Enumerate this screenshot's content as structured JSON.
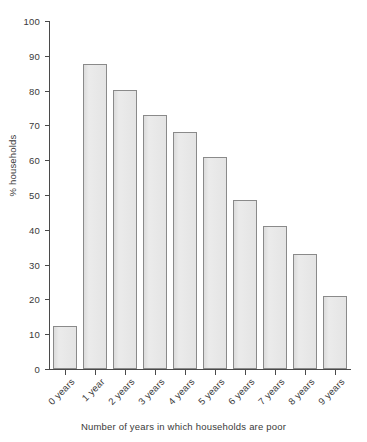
{
  "chart_data": {
    "type": "bar",
    "title": "",
    "xlabel": "Number of years in which households are poor",
    "ylabel": "% households",
    "categories": [
      "0 years",
      "1 year",
      "2 years",
      "3 years",
      "4 years",
      "5 years",
      "6 years",
      "7 years",
      "8 years",
      "9 years"
    ],
    "values": [
      12.4,
      87.6,
      80.2,
      73.0,
      68.1,
      60.9,
      48.6,
      41.1,
      33.0,
      21.0
    ],
    "ylim": [
      0,
      100
    ],
    "yticks": [
      0,
      10,
      20,
      30,
      40,
      50,
      60,
      70,
      80,
      90,
      100
    ],
    "ytick_labels": [
      "0",
      "10",
      "20",
      "30",
      "40",
      "50",
      "60",
      "70",
      "80",
      "90",
      "100"
    ],
    "grid": false,
    "legend": null,
    "bar_fill_color": "#e6e6e6",
    "bar_border_color": "#8a8a8a",
    "axis_color": "#4a4a4a",
    "text_color": "#3a3a3a",
    "background_color": "#ffffff"
  }
}
